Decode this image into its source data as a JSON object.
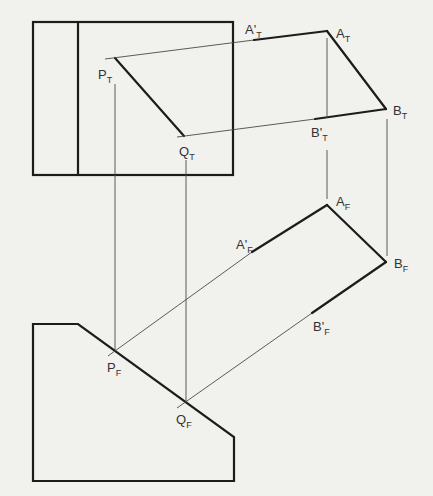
{
  "diagram": {
    "title": "",
    "colors": {
      "line": "#1c1c1c",
      "projector": "#4a4a4a",
      "paper": "#f1f1ee"
    },
    "labels": {
      "PT": {
        "main": "P",
        "sub": "T"
      },
      "QT": {
        "main": "Q",
        "sub": "T"
      },
      "AT": {
        "main": "A",
        "sub": "T"
      },
      "BT": {
        "main": "B",
        "sub": "T"
      },
      "AT_prime": {
        "main": "A'",
        "sub": "T"
      },
      "BT_prime": {
        "main": "B'",
        "sub": "T"
      },
      "AF": {
        "main": "A",
        "sub": "F"
      },
      "BF": {
        "main": "B",
        "sub": "F"
      },
      "AF_prime": {
        "main": "A'",
        "sub": "F"
      },
      "BF_prime": {
        "main": "B'",
        "sub": "F"
      },
      "PF": {
        "main": "P",
        "sub": "F"
      },
      "QF": {
        "main": "Q",
        "sub": "F"
      }
    },
    "views": [
      "top view",
      "front view"
    ]
  }
}
